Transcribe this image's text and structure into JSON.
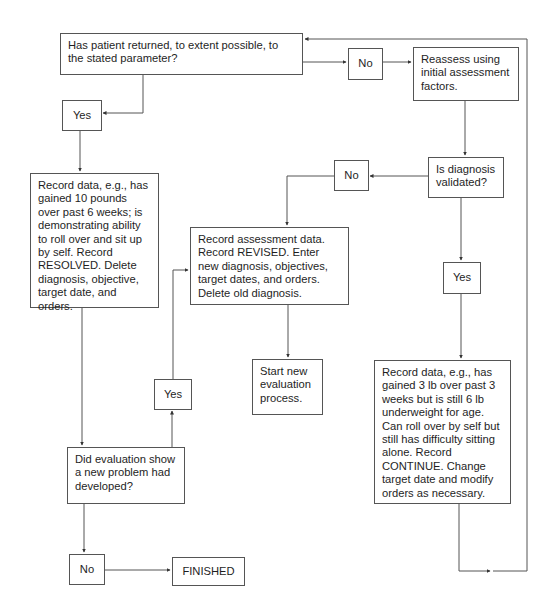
{
  "diagram": {
    "type": "flowchart",
    "nodes": {
      "q_returned": "Has patient returned, to extent possible, to the stated parameter?",
      "yes_1": "Yes",
      "no_1": "No",
      "reassess": "Reassess using initial assessment factors.",
      "q_diagnosis": "Is diagnosis validated?",
      "no_2": "No",
      "yes_2": "Yes",
      "resolved": "Record data, e.g., has gained 10 pounds over past 6 weeks; is demonstrating ability to roll over and sit up by self. Record RESOLVED. Delete diagnosis, objective, target date, and orders.",
      "revised": "Record assessment data. Record REVISED. Enter new diagnosis, objectives, target dates, and orders. Delete old diagnosis.",
      "start_new": "Start new evaluation process.",
      "yes_3": "Yes",
      "continue": "Record data, e.g., has gained 3 lb over past 3 weeks but is still 6 lb underweight for age. Can roll over by self but still has difficulty sitting alone. Record CONTINUE. Change target date and modify orders as necessary.",
      "q_new_problem": "Did evaluation show a new problem had developed?",
      "no_3": "No",
      "finished": "FINISHED"
    },
    "edges": [
      {
        "from": "q_returned",
        "to": "yes_1"
      },
      {
        "from": "q_returned",
        "to": "no_1"
      },
      {
        "from": "no_1",
        "to": "reassess"
      },
      {
        "from": "reassess",
        "to": "q_diagnosis"
      },
      {
        "from": "q_diagnosis",
        "to": "no_2"
      },
      {
        "from": "q_diagnosis",
        "to": "yes_2"
      },
      {
        "from": "no_2",
        "to": "revised"
      },
      {
        "from": "yes_2",
        "to": "continue"
      },
      {
        "from": "continue",
        "to": "q_returned"
      },
      {
        "from": "yes_1",
        "to": "resolved"
      },
      {
        "from": "resolved",
        "to": "q_new_problem"
      },
      {
        "from": "q_new_problem",
        "to": "yes_3"
      },
      {
        "from": "yes_3",
        "to": "revised"
      },
      {
        "from": "revised",
        "to": "start_new"
      },
      {
        "from": "q_new_problem",
        "to": "no_3"
      },
      {
        "from": "no_3",
        "to": "finished"
      }
    ]
  }
}
